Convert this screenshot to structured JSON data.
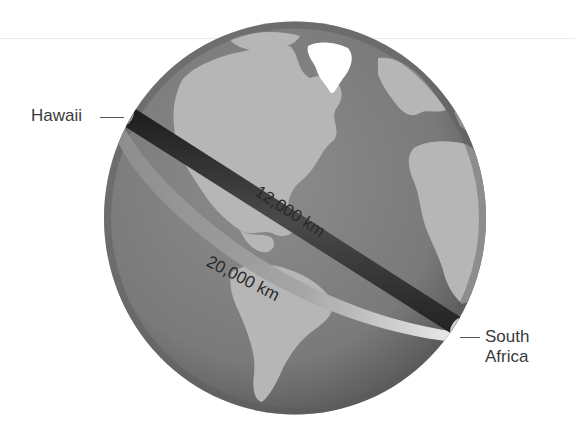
{
  "figure": {
    "type": "globe-distance-illustration",
    "colors": {
      "ocean": "#7e7e7e",
      "ocean_edge": "#5e5e5e",
      "land": "#b4b4b4",
      "ice": "#ffffff",
      "direct_band": "#2e2e2e",
      "surface_band": "#a6a6a6",
      "surface_band_end": "#e6e6e6",
      "text": "#3a3a3a"
    }
  },
  "labels": {
    "start": "Hawaii",
    "end_line1": "South",
    "end_line2": "Africa",
    "direct_distance": "12,000 km",
    "surface_distance": "20,000 km"
  }
}
